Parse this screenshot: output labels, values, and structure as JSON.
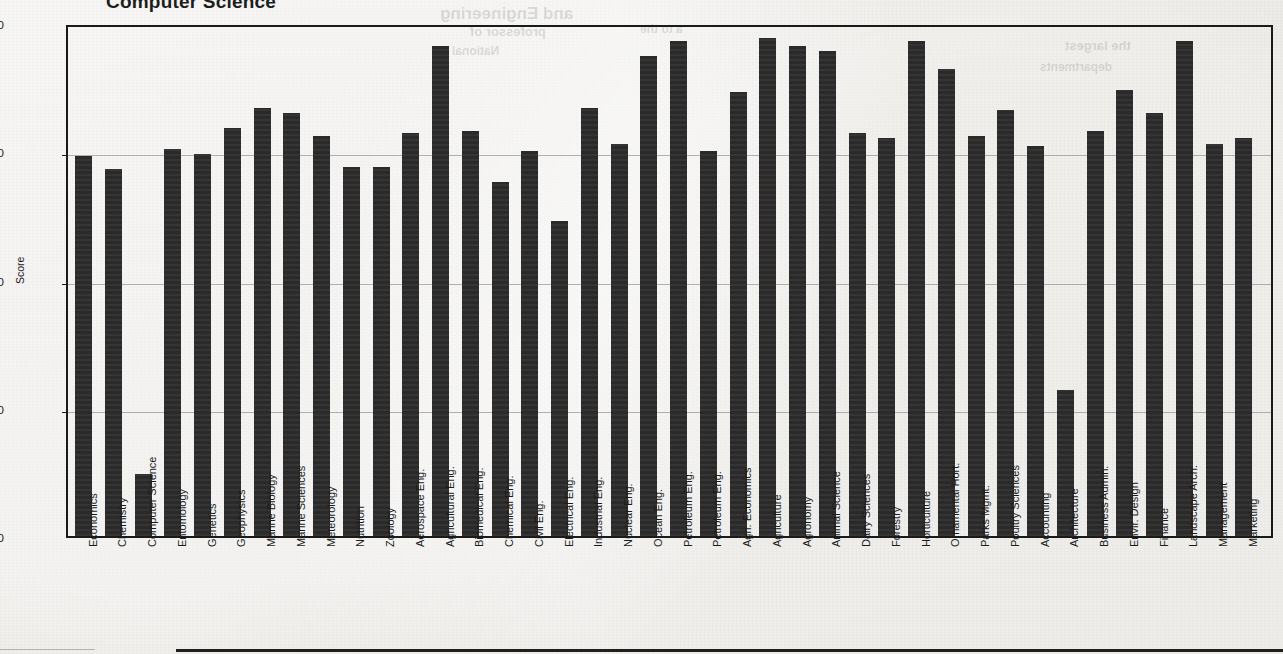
{
  "title": "Computer Science",
  "axis": {
    "ylabel": "Score",
    "yticks": [
      "5.00",
      "4.50",
      "4.00",
      "3.50",
      "3.00"
    ]
  },
  "ghost_text": [
    {
      "text": "and Engineering",
      "x": 440,
      "y": 4,
      "size": 17
    },
    {
      "text": "professor of",
      "x": 470,
      "y": 24,
      "size": 13
    },
    {
      "text": "National",
      "x": 452,
      "y": 44,
      "size": 12
    },
    {
      "text": "a to the",
      "x": 640,
      "y": 22,
      "size": 12
    },
    {
      "text": "the largest",
      "x": 1065,
      "y": 38,
      "size": 13
    },
    {
      "text": "departments",
      "x": 1040,
      "y": 60,
      "size": 12
    }
  ],
  "chart_data": {
    "type": "bar",
    "title": "Computer Science",
    "xlabel": "",
    "ylabel": "Score",
    "ylim": [
      3.0,
      5.0
    ],
    "yticks": [
      3.0,
      3.5,
      4.0,
      4.5,
      5.0
    ],
    "grid": true,
    "legend": "none",
    "bar_color": "#2a2a2a",
    "categories": [
      "Economics",
      "Chemistry",
      "Computer Science",
      "Entomology",
      "Genetics",
      "Geophysics",
      "Marine Biology",
      "Marine Sciences",
      "Meteorology",
      "Nutrition",
      "Zoology",
      "Aerospace Eng.",
      "Agricultural Eng.",
      "Biomedical Eng.",
      "Chemical Eng.",
      "Civil Eng.",
      "Electrical Eng.",
      "Industrial Eng.",
      "Nuclear Eng.",
      "Ocean Eng.",
      "Petroleum Eng.",
      "Petroleum Eng.",
      "Agri. Economics",
      "Agriculture",
      "Agronomy",
      "Animal Science",
      "Dairy Sciences",
      "Forestry",
      "Horticulture",
      "Ornamental Hort.",
      "Parks Mgmt.",
      "Poultry Sciences",
      "Accounting",
      "Architecture",
      "Business Admin.",
      "Envir. Design",
      "Finance",
      "Landscape Arch.",
      "Management",
      "Marketing"
    ],
    "values": [
      4.48,
      4.43,
      3.24,
      4.51,
      4.49,
      4.59,
      4.67,
      4.65,
      4.56,
      4.44,
      4.44,
      4.57,
      4.91,
      4.58,
      4.38,
      4.5,
      4.23,
      4.67,
      4.53,
      4.87,
      4.93,
      4.5,
      4.73,
      4.94,
      4.91,
      4.89,
      4.57,
      4.55,
      4.93,
      4.82,
      4.56,
      4.66,
      4.52,
      3.57,
      4.58,
      4.74,
      4.65,
      4.93,
      4.53,
      4.55
    ]
  }
}
